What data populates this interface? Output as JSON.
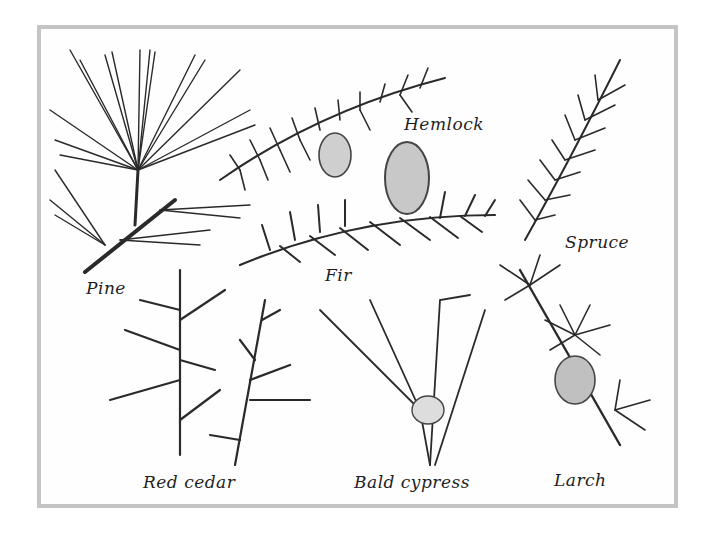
{
  "figure": {
    "labels": {
      "pine": "Pine",
      "hemlock": "Hemlock",
      "fir": "Fir",
      "spruce": "Spruce",
      "red_cedar": "Red cedar",
      "bald_cypress": "Bald cypress",
      "larch": "Larch"
    },
    "colors": {
      "frame": "#c4c4c4",
      "ink": "#2a2a2a",
      "background": "#ffffff"
    }
  }
}
